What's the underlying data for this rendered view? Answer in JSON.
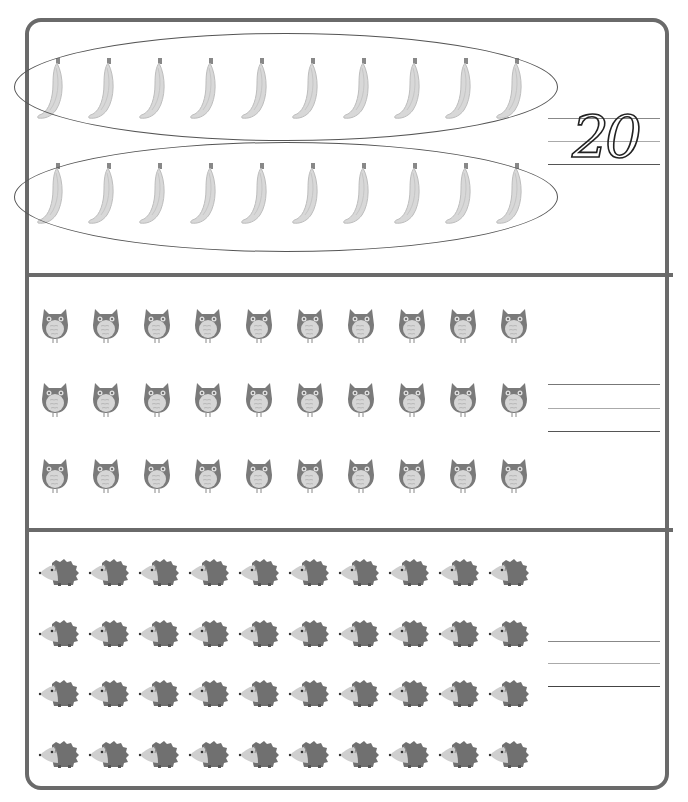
{
  "worksheet": {
    "sections": [
      {
        "name": "bananas",
        "item_icon": "banana-icon",
        "rows": 2,
        "per_row": 10,
        "grouped_by_circles": true,
        "answer": "20"
      },
      {
        "name": "owls",
        "item_icon": "owl-icon",
        "rows": 3,
        "per_row": 10,
        "answer": ""
      },
      {
        "name": "hedgehogs",
        "item_icon": "hedgehog-icon",
        "rows": 4,
        "per_row": 10,
        "answer": ""
      }
    ],
    "colors": {
      "border": "#6a6a6a",
      "banana": "#d8d8d8",
      "owl_body": "#7a7a7a",
      "owl_belly": "#d6d6d6",
      "hedgehog_spines": "#707070",
      "hedgehog_face": "#cfcfcf"
    }
  }
}
